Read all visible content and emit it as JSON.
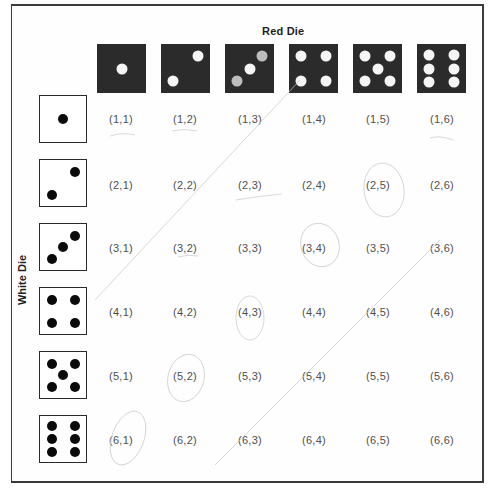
{
  "labels": {
    "red_die": "Red Die",
    "white_die": "White Die"
  },
  "colors": {
    "red_die_fill": "#2b2b2b",
    "red_die_pip": "#f5f5f5",
    "white_die_fill": "#ffffff",
    "white_die_pip": "#0a0a0a",
    "outcome_text": "#505050"
  },
  "red_dice": [
    {
      "value": 1,
      "name": "red-die-1"
    },
    {
      "value": 2,
      "name": "red-die-2"
    },
    {
      "value": 3,
      "name": "red-die-3"
    },
    {
      "value": 4,
      "name": "red-die-4"
    },
    {
      "value": 5,
      "name": "red-die-5"
    },
    {
      "value": 6,
      "name": "red-die-6"
    }
  ],
  "white_dice": [
    {
      "value": 1,
      "name": "white-die-1"
    },
    {
      "value": 2,
      "name": "white-die-2"
    },
    {
      "value": 3,
      "name": "white-die-3"
    },
    {
      "value": 4,
      "name": "white-die-4"
    },
    {
      "value": 5,
      "name": "white-die-5"
    },
    {
      "value": 6,
      "name": "white-die-6"
    }
  ],
  "outcomes": [
    [
      "(1,1)",
      "(1,2)",
      "(1,3)",
      "(1,4)",
      "(1,5)",
      "(1,6)"
    ],
    [
      "(2,1)",
      "(2,2)",
      "(2,3)",
      "(2,4)",
      "(2,5)",
      "(2,6)"
    ],
    [
      "(3,1)",
      "(3,2)",
      "(3,3)",
      "(3,4)",
      "(3,5)",
      "(3,6)"
    ],
    [
      "(4,1)",
      "(4,2)",
      "(4,3)",
      "(4,4)",
      "(4,5)",
      "(4,6)"
    ],
    [
      "(5,1)",
      "(5,2)",
      "(5,3)",
      "(5,4)",
      "(5,5)",
      "(5,6)"
    ],
    [
      "(6,1)",
      "(6,2)",
      "(6,3)",
      "(6,4)",
      "(6,5)",
      "(6,6)"
    ]
  ],
  "annotations": {
    "circled_outcomes": [
      "(2,5)",
      "(3,4)",
      "(4,3)",
      "(5,2)",
      "(6,1)"
    ]
  }
}
